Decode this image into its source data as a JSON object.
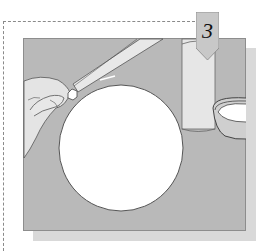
{
  "illustration": {
    "step_badge": {
      "label": "3"
    },
    "description": "Hand holding a sewing needle threading a bead over a round white plate, with a cylinder and a small bowl on a gray surface",
    "colors": {
      "surface": "#b9b9b9",
      "shadow": "#d9d9d9",
      "plate": "#ffffff",
      "outline": "#4a4a4a",
      "badge": "#c8c8c8"
    },
    "objects": [
      "hand-icon",
      "needle-icon",
      "bead-icon",
      "plate-icon",
      "cylinder-icon",
      "bowl-icon"
    ]
  }
}
